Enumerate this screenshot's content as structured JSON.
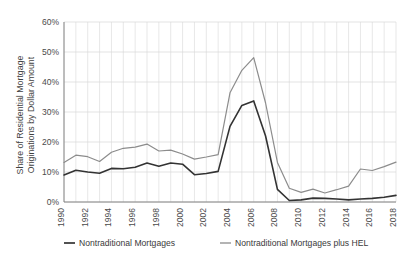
{
  "chart_data": {
    "type": "line",
    "title": "",
    "xlabel": "",
    "ylabel": "Share of Residential Mortgage Originations by Dollar Amount",
    "ylim": [
      0,
      60
    ],
    "xlim": [
      1990,
      2018
    ],
    "grid": "both",
    "legend_position": "bottom",
    "y_tick_labels": [
      "0%",
      "10%",
      "20%",
      "30%",
      "40%",
      "50%",
      "60%"
    ],
    "y_ticks": [
      0,
      10,
      20,
      30,
      40,
      50,
      60
    ],
    "x_tick_labels": [
      "1990",
      "1992",
      "1994",
      "1996",
      "1998",
      "2000",
      "2002",
      "2004",
      "2006",
      "2008",
      "2010",
      "2012",
      "2014",
      "2016",
      "2018"
    ],
    "x_ticks": [
      1990,
      1992,
      1994,
      1996,
      1998,
      2000,
      2002,
      2004,
      2006,
      2008,
      2010,
      2012,
      2014,
      2016,
      2018
    ],
    "x": [
      1990,
      1991,
      1992,
      1993,
      1994,
      1995,
      1996,
      1997,
      1998,
      1999,
      2000,
      2001,
      2002,
      2003,
      2004,
      2005,
      2006,
      2007,
      2008,
      2009,
      2010,
      2011,
      2012,
      2013,
      2014,
      2015,
      2016,
      2017,
      2018
    ],
    "series": [
      {
        "name": "Nontraditional Mortgages",
        "color": "#333333",
        "width": 1.6,
        "values": [
          9.0,
          10.6,
          10.0,
          9.6,
          11.2,
          11.1,
          11.6,
          13.0,
          11.9,
          13.0,
          12.6,
          9.1,
          9.5,
          10.2,
          25.2,
          32.2,
          33.7,
          22.0,
          4.2,
          0.5,
          0.7,
          1.3,
          1.2,
          1.0,
          0.7,
          1.0,
          1.2,
          1.6,
          2.2
        ]
      },
      {
        "name": "Nontraditional Mortgages plus HEL",
        "color": "#8c8c8c",
        "width": 1.2,
        "values": [
          13.2,
          15.6,
          15.1,
          13.5,
          16.6,
          17.9,
          18.3,
          19.3,
          17.0,
          17.3,
          16.0,
          14.3,
          15.0,
          15.8,
          36.4,
          43.9,
          48.1,
          33.0,
          13.2,
          4.6,
          3.2,
          4.3,
          3.0,
          4.1,
          5.3,
          11.0,
          10.5,
          11.8,
          13.3
        ]
      }
    ]
  },
  "legend": {
    "items": [
      {
        "label": "Nontraditional Mortgages",
        "color": "#333333"
      },
      {
        "label": "Nontraditional Mortgages plus HEL",
        "color": "#8c8c8c"
      }
    ]
  },
  "axes": {
    "y_axis_label": "Share of Residential Mortgage Originations by Dollar Amount",
    "y_axis_label_line1": "Share of Residential Mortgage",
    "y_axis_label_line2": "Originations by Dollar Amount"
  }
}
